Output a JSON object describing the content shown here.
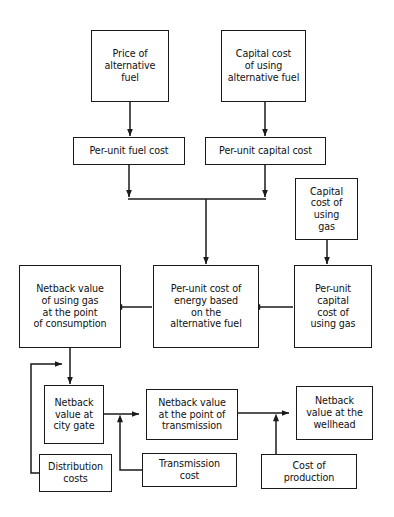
{
  "diagram": {
    "type": "flowchart",
    "canvas": {
      "width": 394,
      "height": 517
    },
    "style": {
      "box_fill": "#ffffff",
      "box_stroke": "#1a1a1a",
      "edge_stroke": "#1a1a1a",
      "background": "#ffffff",
      "text_color": "#111111"
    },
    "nodes": [
      {
        "id": "price-alt-fuel",
        "label": "Price of\nalternative\nfuel",
        "x": 91,
        "y": 30,
        "w": 78,
        "h": 72,
        "font": 9.6
      },
      {
        "id": "capital-cost-alt-fuel",
        "label": "Capital cost\nof using\nalternative fuel",
        "x": 221,
        "y": 30,
        "w": 85,
        "h": 72,
        "font": 9.6
      },
      {
        "id": "per-unit-fuel-cost",
        "label": "Per-unit fuel cost",
        "x": 73,
        "y": 137,
        "w": 112,
        "h": 28,
        "font": 9.6
      },
      {
        "id": "per-unit-capital-cost",
        "label": "Per-unit capital cost",
        "x": 205,
        "y": 137,
        "w": 121,
        "h": 28,
        "font": 9.6
      },
      {
        "id": "capital-cost-gas",
        "label": "Capital\ncost of\nusing\ngas",
        "x": 295,
        "y": 178,
        "w": 63,
        "h": 62,
        "font": 9.6
      },
      {
        "id": "netback-consumption",
        "label": "Netback value\nof using gas\nat the point\nof consumption",
        "x": 19,
        "y": 265,
        "w": 102,
        "h": 83,
        "font": 9.6
      },
      {
        "id": "per-unit-cost-energy",
        "label": "Per-unit cost of\nenergy based\non the\nalternative fuel",
        "x": 153,
        "y": 265,
        "w": 106,
        "h": 83,
        "font": 9.6
      },
      {
        "id": "per-unit-capital-cost-gas",
        "label": "Per-unit\ncapital\ncost of\nusing gas",
        "x": 294,
        "y": 265,
        "w": 78,
        "h": 83,
        "font": 9.6
      },
      {
        "id": "netback-city-gate",
        "label": "Netback\nvalue at\ncity gate",
        "x": 44,
        "y": 385,
        "w": 60,
        "h": 59,
        "font": 9.6
      },
      {
        "id": "netback-transmission",
        "label": "Netback value\nat the point of\ntransmission",
        "x": 146,
        "y": 389,
        "w": 92,
        "h": 51,
        "font": 9.6
      },
      {
        "id": "netback-wellhead",
        "label": "Netback\nvalue at the\nwellhead",
        "x": 296,
        "y": 386,
        "w": 77,
        "h": 54,
        "font": 9.6
      },
      {
        "id": "distribution-costs",
        "label": "Distribution\ncosts",
        "x": 39,
        "y": 454,
        "w": 73,
        "h": 38,
        "font": 9.6
      },
      {
        "id": "transmission-cost",
        "label": "Transmission\ncost",
        "x": 142,
        "y": 453,
        "w": 95,
        "h": 34,
        "font": 9.6
      },
      {
        "id": "cost-of-production",
        "label": "Cost of\nproduction",
        "x": 261,
        "y": 454,
        "w": 96,
        "h": 35,
        "font": 9.6
      }
    ],
    "edges": [
      {
        "from": "price-alt-fuel",
        "to": "per-unit-fuel-cost",
        "direction": "down"
      },
      {
        "from": "capital-cost-alt-fuel",
        "to": "per-unit-capital-cost",
        "direction": "down"
      },
      {
        "from": "per-unit-fuel-cost",
        "to": "merge-bar",
        "direction": "down"
      },
      {
        "from": "per-unit-capital-cost",
        "to": "merge-bar",
        "direction": "down"
      },
      {
        "from": "merge-bar",
        "to": "per-unit-cost-energy",
        "direction": "down"
      },
      {
        "from": "capital-cost-gas",
        "to": "per-unit-capital-cost-gas",
        "direction": "down"
      },
      {
        "from": "per-unit-capital-cost-gas",
        "to": "per-unit-cost-energy",
        "direction": "left"
      },
      {
        "from": "per-unit-cost-energy",
        "to": "netback-consumption",
        "direction": "left"
      },
      {
        "from": "netback-consumption",
        "to": "netback-city-gate",
        "direction": "down"
      },
      {
        "from": "distribution-costs",
        "to": "netback-city-gate-feed",
        "direction": "right"
      },
      {
        "from": "netback-city-gate",
        "to": "netback-transmission",
        "direction": "right"
      },
      {
        "from": "transmission-cost",
        "to": "netback-transmission-feed",
        "direction": "up"
      },
      {
        "from": "netback-transmission",
        "to": "netback-wellhead",
        "direction": "right"
      },
      {
        "from": "cost-of-production",
        "to": "netback-wellhead-feed",
        "direction": "up"
      }
    ]
  }
}
